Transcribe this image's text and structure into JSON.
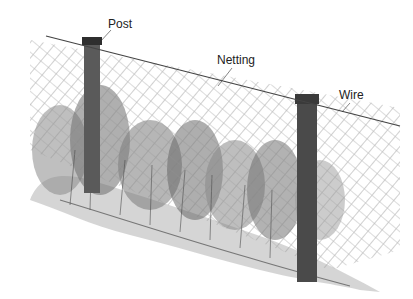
{
  "diagram": {
    "labels": [
      {
        "id": "post",
        "text": "Post",
        "x": 108,
        "y": 18
      },
      {
        "id": "netting",
        "text": "Netting",
        "x": 217,
        "y": 54
      },
      {
        "id": "wire",
        "text": "Wire",
        "x": 339,
        "y": 89
      }
    ],
    "colors": {
      "background": "#ffffff",
      "ink": "#222222",
      "wire": "#444444",
      "netting": "#9a9a9a",
      "post": "#3a3a3a",
      "foliage_dark": "#555555",
      "foliage_light": "#a8a8a8",
      "ground": "#c4c4c4"
    }
  }
}
